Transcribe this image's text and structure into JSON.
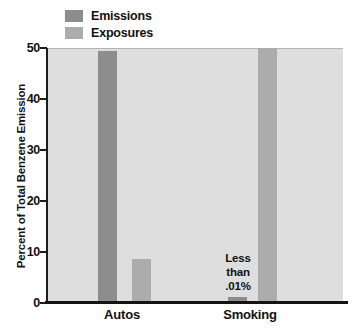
{
  "figure": {
    "background": "#ffffff",
    "panel_background": "#dedede",
    "axis_color": "#1c1c1c",
    "text_color": "#111111"
  },
  "chart_data": {
    "type": "bar",
    "categories": [
      "Autos",
      "Smoking"
    ],
    "series": [
      {
        "name": "Emissions",
        "color": "#8d8d8d",
        "values": [
          49.5,
          0.01
        ],
        "drawn_percents": [
          49.5,
          1.2
        ],
        "note": "Smoking emissions value is labeled 'Less than .01%' and drawn as a small stub"
      },
      {
        "name": "Exposures",
        "color": "#acacac",
        "values": [
          8.7,
          50
        ],
        "drawn_percents": [
          8.7,
          50
        ]
      }
    ],
    "title": "",
    "xlabel": "",
    "ylabel": "Percent of Total Benzene Emission",
    "ylim": [
      0,
      50
    ],
    "yticks": [
      0,
      10,
      20,
      30,
      40,
      50
    ],
    "grid": false,
    "legend_position": "top-left",
    "annotation": {
      "target": "Smoking Emissions bar",
      "lines": [
        "Less",
        "than",
        ".01%"
      ]
    }
  }
}
